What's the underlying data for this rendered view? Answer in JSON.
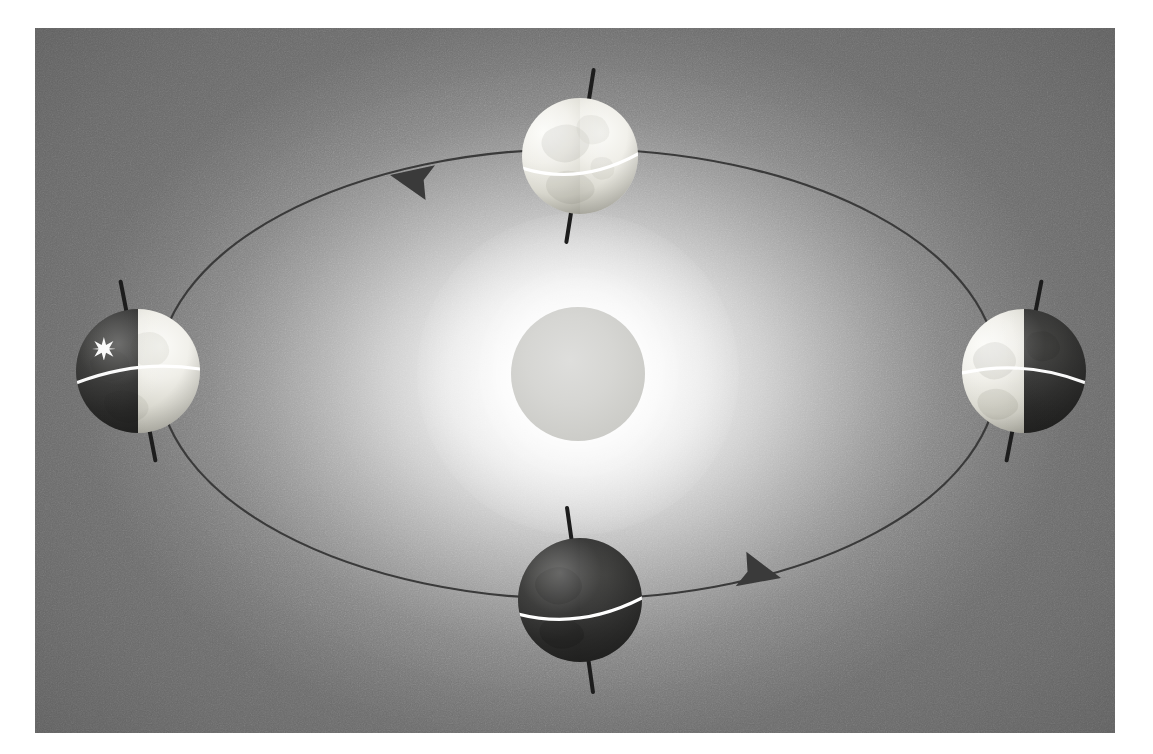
{
  "figure": {
    "background_color": "#8d8d8d",
    "panel": {
      "x": 35,
      "y": 28,
      "width": 1080,
      "height": 705
    },
    "canvas": {
      "width": 1153,
      "height": 754
    }
  },
  "sun": {
    "name": "sun",
    "label": "Sun",
    "center": {
      "x": 578,
      "y": 374
    },
    "radius": 67,
    "color": "#d6d6d3",
    "glow_color": "#ffffff"
  },
  "orbit": {
    "name": "orbit-ellipse",
    "label": "Orbital path",
    "center": {
      "x": 578,
      "y": 374
    },
    "radius_x": 420,
    "radius_y": 225,
    "stroke_color": "#3a3a3a",
    "stroke_width": 2.2,
    "direction": "counterclockwise",
    "arrows": [
      {
        "name": "orbit-arrow-top-left",
        "x": 390,
        "y": 175,
        "points": "left",
        "rotation": -168
      },
      {
        "name": "orbit-arrow-bottom-right",
        "x": 781,
        "y": 578,
        "points": "right",
        "rotation": 14
      }
    ]
  },
  "earths": [
    {
      "name": "earth-left",
      "label": "Earth (left position)",
      "position": {
        "x": 138,
        "y": 371
      },
      "radius": 62,
      "axis_tilt_deg": -11,
      "axis_length": 186,
      "illumination": "right-half-lit",
      "lit_side": "right",
      "dark_side": "left",
      "equator_visible": true,
      "equator_color": "#ffffff",
      "marker": {
        "name": "location-star-marker",
        "label": "Observer location marker",
        "shape": "six-pointed-star",
        "color": "#ffffff",
        "x": 101,
        "y": 346,
        "size": 19
      }
    },
    {
      "name": "earth-top",
      "label": "Earth (top position)",
      "position": {
        "x": 580,
        "y": 156
      },
      "radius": 58,
      "axis_tilt_deg": 9,
      "axis_length": 178,
      "illumination": "fully-lit",
      "lit_side": "both",
      "dark_side": "none",
      "equator_visible": true,
      "equator_color": "#ffffff",
      "marker": null
    },
    {
      "name": "earth-right",
      "label": "Earth (right position)",
      "position": {
        "x": 1024,
        "y": 371
      },
      "radius": 62,
      "axis_tilt_deg": 11,
      "axis_length": 186,
      "illumination": "left-half-lit",
      "lit_side": "left",
      "dark_side": "right",
      "equator_visible": true,
      "equator_color": "#ffffff",
      "marker": null
    },
    {
      "name": "earth-bottom",
      "label": "Earth (bottom position)",
      "position": {
        "x": 580,
        "y": 600
      },
      "radius": 62,
      "axis_tilt_deg": -8,
      "axis_length": 190,
      "illumination": "fully-dark",
      "lit_side": "none",
      "dark_side": "both",
      "equator_visible": true,
      "equator_color": "#ffffff",
      "marker": null
    }
  ],
  "colors": {
    "lit_hemisphere": "#ece"
  }
}
